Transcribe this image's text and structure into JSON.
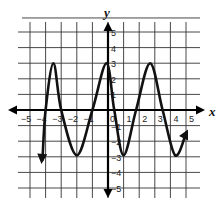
{
  "chart_data": {
    "type": "line",
    "title": "",
    "xlabel": "x",
    "ylabel": "y",
    "xlim": [
      -5,
      5
    ],
    "ylim": [
      -5,
      5
    ],
    "grid": true,
    "x_ticks": [
      "-5",
      "-4",
      "-3",
      "-2",
      "-1",
      "0",
      "1",
      "2",
      "3",
      "4",
      "5"
    ],
    "y_ticks": [
      "5",
      "4",
      "3",
      "2",
      "1",
      "-1",
      "-2",
      "-3",
      "-4",
      "-5"
    ],
    "series": [
      {
        "name": "curve",
        "x": [
          -4.2,
          -4.0,
          -3.5,
          -3.0,
          -2.0,
          -1.0,
          -0.1,
          0.4,
          1.0,
          1.8,
          2.7,
          3.5,
          4.3,
          5.0
        ],
        "y": [
          -3.2,
          0.0,
          3.0,
          0.0,
          -2.9,
          0.0,
          3.0,
          0.0,
          -2.9,
          0.0,
          3.0,
          0.0,
          -2.9,
          -1.5
        ],
        "arrows": "both ends"
      }
    ],
    "maxima": [
      [
        -3.5,
        3
      ],
      [
        -0.1,
        3
      ],
      [
        2.7,
        3
      ]
    ],
    "minima": [
      [
        -2.0,
        -2.9
      ],
      [
        1.0,
        -2.9
      ],
      [
        4.3,
        -2.9
      ]
    ]
  },
  "labels": {
    "x_axis": "x",
    "y_axis": "y"
  },
  "colors": {
    "grid": "#333333",
    "curve": "#111111",
    "background": "#ffffff"
  }
}
